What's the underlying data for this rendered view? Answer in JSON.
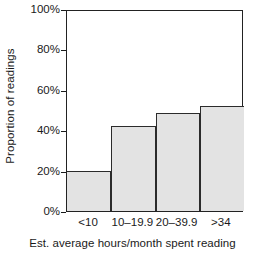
{
  "chart_data": {
    "type": "bar",
    "title": "",
    "subtitle": "",
    "categories": [
      "<10",
      "10–19.9",
      "20–39.9",
      ">34"
    ],
    "values": [
      20,
      42,
      48.5,
      52
    ],
    "xlabel": "Est. average hours/month spent reading",
    "ylabel": "Proportion of readings",
    "ylim": [
      0,
      100
    ],
    "yticks": [
      0,
      20,
      40,
      60,
      80,
      100
    ],
    "ytick_labels": [
      "0%",
      "20%",
      "40%",
      "60%",
      "80%",
      "100%"
    ],
    "grid": false,
    "legend": false,
    "legend_position": "none",
    "bar_fill_color": "#e3e3e3",
    "bar_edge_color": "#2b2b2b",
    "axis_color": "#222222",
    "background_color": "#ffffff"
  }
}
